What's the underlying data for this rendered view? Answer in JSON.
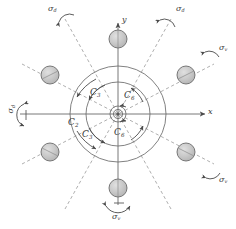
{
  "figure": {
    "background_color": "#ffffff",
    "line_color": "#5a5a5a",
    "dash_color": "#8a8a8a",
    "atom_fill": "#c8c8c8",
    "atom_stroke": "#6b6b6b",
    "text_color": "#3a3a3a"
  },
  "axes": {
    "x_label": "x",
    "y_label": "y"
  },
  "rotation_axes": [
    {
      "id": "c2-left",
      "symbol": "C",
      "subscript": "2",
      "label": "C2"
    },
    {
      "id": "c3-upper",
      "symbol": "C",
      "subscript": "3",
      "label": "C3"
    },
    {
      "id": "c3-lower",
      "symbol": "C",
      "subscript": "3",
      "label": "C3"
    },
    {
      "id": "c6-upper",
      "symbol": "C",
      "subscript": "6",
      "label": "C6"
    },
    {
      "id": "c6-lower",
      "symbol": "C",
      "subscript": "6",
      "label": "C6"
    }
  ],
  "mirror_planes": [
    {
      "id": "sigma-d-top-left",
      "symbol": "σ",
      "subscript": "d",
      "label": "σd"
    },
    {
      "id": "sigma-d-top-right",
      "symbol": "σ",
      "subscript": "d",
      "label": "σd"
    },
    {
      "id": "sigma-d-left",
      "symbol": "σ",
      "subscript": "d",
      "label": "σd"
    },
    {
      "id": "sigma-v-right-upper",
      "symbol": "σ",
      "subscript": "v",
      "label": "σv"
    },
    {
      "id": "sigma-v-right-lower",
      "symbol": "σ",
      "subscript": "v",
      "label": "σv"
    },
    {
      "id": "sigma-v-bottom",
      "symbol": "σ",
      "subscript": "v",
      "label": "σv"
    }
  ],
  "atoms": [
    {
      "id": "atom-90",
      "angle_deg": 90,
      "cx": 118,
      "cy": 39
    },
    {
      "id": "atom-150",
      "angle_deg": 150,
      "cx": 50,
      "cy": 75
    },
    {
      "id": "atom-210",
      "angle_deg": 210,
      "cx": 50,
      "cy": 152
    },
    {
      "id": "atom-270",
      "angle_deg": 270,
      "cx": 118,
      "cy": 188
    },
    {
      "id": "atom-330",
      "angle_deg": 330,
      "cx": 186,
      "cy": 152
    },
    {
      "id": "atom-30",
      "angle_deg": 30,
      "cx": 186,
      "cy": 75
    }
  ],
  "center": {
    "cx": 118,
    "cy": 114
  },
  "rings": [
    {
      "id": "ring-outer",
      "r": 48
    },
    {
      "id": "ring-middle",
      "r": 32
    },
    {
      "id": "ring-inner",
      "r": 8
    }
  ]
}
